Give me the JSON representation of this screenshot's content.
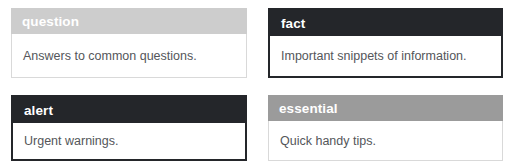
{
  "page": {
    "background": "#ffffff"
  },
  "callouts": [
    {
      "id": "question",
      "title": "question",
      "body": "Answers to common questions.",
      "header_bg": "#cdcdcd",
      "header_fg": "#ffffff",
      "body_bg": "#ffffff",
      "body_fg": "#54565a",
      "border_color": "#d9d9d9",
      "frame": "thin",
      "column": "left",
      "row": "top"
    },
    {
      "id": "fact",
      "title": "fact",
      "body": "Important snippets of information.",
      "header_bg": "#24262a",
      "header_fg": "#ffffff",
      "body_bg": "#ffffff",
      "body_fg": "#54565a",
      "border_color": "#24262a",
      "frame": "thick",
      "column": "right",
      "row": "top"
    },
    {
      "id": "alert",
      "title": "alert",
      "body": "Urgent warnings.",
      "header_bg": "#24262a",
      "header_fg": "#ffffff",
      "body_bg": "#ffffff",
      "body_fg": "#54565a",
      "border_color": "#24262a",
      "frame": "thick",
      "column": "left",
      "row": "bottom"
    },
    {
      "id": "essential",
      "title": "essential",
      "body": "Quick handy tips.",
      "header_bg": "#9b9b9b",
      "header_fg": "#ffffff",
      "body_bg": "#ffffff",
      "body_fg": "#54565a",
      "border_color": "#d9d9d9",
      "frame": "thin",
      "column": "right",
      "row": "bottom"
    }
  ]
}
